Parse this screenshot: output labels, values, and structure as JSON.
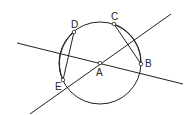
{
  "diagram": {
    "type": "geometry",
    "circle": {
      "center": "A",
      "cx": 100,
      "cy": 63,
      "r": 41
    },
    "points": [
      {
        "label": "A",
        "x": 100,
        "y": 63
      },
      {
        "label": "B",
        "x": 141,
        "y": 64
      },
      {
        "label": "C",
        "x": 114,
        "y": 24
      },
      {
        "label": "D",
        "x": 74,
        "y": 32
      },
      {
        "label": "E",
        "x": 63,
        "y": 80
      }
    ],
    "lines": [
      {
        "x1": 17,
        "y1": 43,
        "x2": 183,
        "y2": 84
      },
      {
        "x1": 30,
        "y1": 114,
        "x2": 171,
        "y2": 14
      }
    ],
    "chords": [
      [
        "C",
        "B"
      ],
      [
        "D",
        "E"
      ]
    ],
    "colors": {
      "stroke": "#222222",
      "background": "#ffffff"
    }
  }
}
